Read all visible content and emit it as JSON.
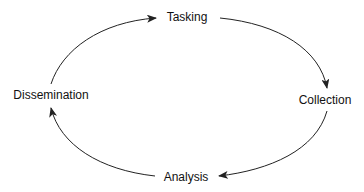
{
  "diagram": {
    "type": "cycle",
    "nodes": [
      {
        "id": "tasking",
        "label": "Tasking"
      },
      {
        "id": "collection",
        "label": "Collection"
      },
      {
        "id": "analysis",
        "label": "Analysis"
      },
      {
        "id": "dissemination",
        "label": "Dissemination"
      }
    ],
    "edges": [
      {
        "from": "dissemination",
        "to": "tasking"
      },
      {
        "from": "tasking",
        "to": "collection"
      },
      {
        "from": "collection",
        "to": "analysis"
      },
      {
        "from": "analysis",
        "to": "dissemination"
      }
    ],
    "colors": {
      "stroke": "#222222",
      "text": "#111111",
      "background": "#ffffff"
    }
  }
}
